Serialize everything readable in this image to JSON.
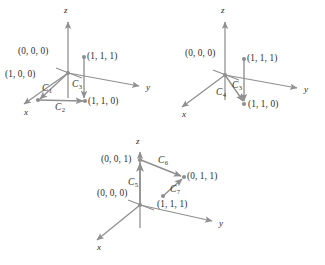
{
  "figure": {
    "type": "math-vector-field-diagram",
    "line_color": "#8f8f8f",
    "text_color": "#2b2b2b",
    "background": "#ffffff"
  },
  "diagrams": [
    {
      "id": "diagram-1",
      "axes": [
        {
          "name": "x",
          "label": "x"
        },
        {
          "name": "y",
          "label": "y"
        },
        {
          "name": "z",
          "label": "z"
        }
      ],
      "points": [
        {
          "label": "(0, 0, 0)",
          "name": "origin"
        },
        {
          "label": "(1, 0, 0)",
          "name": "point-100"
        },
        {
          "label": "(1, 1, 1)",
          "name": "point-111"
        },
        {
          "label": "(1, 1, 0)",
          "name": "point-110"
        }
      ],
      "curves": [
        {
          "label": "C",
          "sub": "1",
          "from": "(0, 0, 0)",
          "to": "(1, 0, 0)"
        },
        {
          "label": "C",
          "sub": "2",
          "from": "(1, 0, 0)",
          "to": "(1, 1, 0)"
        },
        {
          "label": "C",
          "sub": "3",
          "from": "(1, 1, 1)",
          "to": "(1, 1, 0)"
        }
      ]
    },
    {
      "id": "diagram-2",
      "axes": [
        {
          "name": "x",
          "label": "x"
        },
        {
          "name": "y",
          "label": "y"
        },
        {
          "name": "z",
          "label": "z"
        }
      ],
      "points": [
        {
          "label": "(0, 0, 0)",
          "name": "origin"
        },
        {
          "label": "(1, 1, 1)",
          "name": "point-111"
        },
        {
          "label": "(1, 1, 0)",
          "name": "point-110"
        }
      ],
      "curves": [
        {
          "label": "C",
          "sub": "4",
          "from": "(0, 0, 0)",
          "to": "(1, 1, 0)"
        },
        {
          "label": "C",
          "sub": "3",
          "from": "(1, 1, 1)",
          "to": "(1, 1, 0)"
        }
      ]
    },
    {
      "id": "diagram-3",
      "axes": [
        {
          "name": "x",
          "label": "x"
        },
        {
          "name": "y",
          "label": "y"
        },
        {
          "name": "z",
          "label": "z"
        }
      ],
      "points": [
        {
          "label": "(0, 0, 1)",
          "name": "point-001"
        },
        {
          "label": "(0, 0, 0)",
          "name": "origin"
        },
        {
          "label": "(0, 1, 1)",
          "name": "point-011"
        },
        {
          "label": "(1, 1, 1)",
          "name": "point-111"
        }
      ],
      "curves": [
        {
          "label": "C",
          "sub": "5",
          "from": "(0, 0, 0)",
          "to": "(0, 0, 1)"
        },
        {
          "label": "C",
          "sub": "6",
          "from": "(0, 0, 1)",
          "to": "(0, 1, 1)"
        },
        {
          "label": "C",
          "sub": "7",
          "from": "(1, 1, 1)",
          "to": "(0, 1, 1)"
        }
      ]
    }
  ],
  "labels": {
    "d1": {
      "axis_x": "x",
      "axis_y": "y",
      "axis_z": "z",
      "p_origin": "(0, 0, 0)",
      "p_100": "(1, 0, 0)",
      "p_111": "(1, 1, 1)",
      "p_110": "(1, 1, 0)",
      "c1": "C",
      "c1_sub": "1",
      "c2": "C",
      "c2_sub": "2",
      "c3": "C",
      "c3_sub": "3"
    },
    "d2": {
      "axis_x": "x",
      "axis_y": "y",
      "axis_z": "z",
      "p_origin": "(0, 0, 0)",
      "p_111": "(1, 1, 1)",
      "p_110": "(1, 1, 0)",
      "c4": "C",
      "c4_sub": "4",
      "c3": "C",
      "c3_sub": "3"
    },
    "d3": {
      "axis_x": "x",
      "axis_y": "y",
      "axis_z": "z",
      "p_001": "(0, 0, 1)",
      "p_origin": "(0, 0, 0)",
      "p_011": "(0, 1, 1)",
      "p_111": "(1, 1, 1)",
      "c5": "C",
      "c5_sub": "5",
      "c6": "C",
      "c6_sub": "6",
      "c7": "C",
      "c7_sub": "7"
    }
  }
}
